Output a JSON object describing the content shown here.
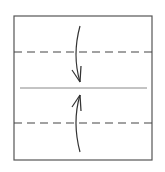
{
  "diagram": {
    "type": "origami-fold-diagram",
    "colors": {
      "background": "#ffffff",
      "outline": "#555555",
      "dashed_line": "#444444",
      "center_line": "#888888",
      "arrow": "#333333"
    },
    "paper": {
      "x": 14,
      "y": 16,
      "width": 138,
      "height": 144
    },
    "fold_lines": [
      {
        "name": "top-valley-fold",
        "style": "dashed",
        "y": 52
      },
      {
        "name": "bottom-valley-fold",
        "style": "dashed",
        "y": 123
      }
    ],
    "center_line": {
      "y": 88,
      "x1": 20,
      "x2": 147
    },
    "arrows": [
      {
        "name": "fold-down-arrow",
        "direction": "down",
        "from_y": 26,
        "to_y": 82
      },
      {
        "name": "fold-up-arrow",
        "direction": "up",
        "from_y": 152,
        "to_y": 95
      }
    ]
  }
}
